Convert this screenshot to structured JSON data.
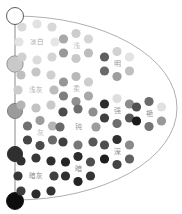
{
  "figure": {
    "background": "#ffffff",
    "outline": {
      "color": "#9a9a9a",
      "width": 0.8,
      "ellipse": {
        "cx": 15,
        "cy": 108,
        "rx": 162,
        "ry": 92
      }
    },
    "gray_axis": {
      "x": 15,
      "y_top": 16,
      "y_bottom": 200,
      "line_color": "#8a8a8a",
      "line_width": 1,
      "circles": [
        {
          "name": "white",
          "cy": 16,
          "r": 8.5,
          "fill": "#ffffff",
          "stroke": "#4a4a4a"
        },
        {
          "name": "light-gray",
          "cy": 64,
          "r": 8.2,
          "fill": "#c9c9c9",
          "stroke": "#8e8e8e"
        },
        {
          "name": "medium-gray",
          "cy": 111,
          "r": 7.6,
          "fill": "#9b9b9b",
          "stroke": "#7a7a7a"
        },
        {
          "name": "dark-gray",
          "cy": 154,
          "r": 7.6,
          "fill": "#2f2f2f",
          "stroke": "#2a2a2a"
        },
        {
          "name": "black",
          "cy": 201,
          "r": 8.5,
          "fill": "#0d0d0d",
          "stroke": "#0d0d0d"
        }
      ]
    },
    "tone_clusters": [
      {
        "tone": "pale",
        "label": "淡白",
        "cx": 37,
        "cy": 42,
        "ring": "oct",
        "label_color": "#a8a8a8",
        "font": 6.5,
        "dots": [
          "#e2e2e2",
          "#d8d8d8",
          "#e6e6e6",
          "#d4d4d4",
          "#dcdcdc",
          "#d0d0d0",
          "#e4e4e4",
          "#dadada"
        ]
      },
      {
        "tone": "light",
        "label": "浅",
        "cx": 76,
        "cy": 46,
        "ring": "hex",
        "label_color": "#c2c2c2",
        "font": 7,
        "dots": [
          "#cdcdcd",
          "#d5d5d5",
          "#bdbdbd",
          "#c9c9c9",
          "#989898",
          "#a8a8a8"
        ]
      },
      {
        "tone": "bright",
        "label": "明",
        "cx": 117,
        "cy": 64,
        "ring": "hex",
        "label_color": "#9a9a9a",
        "font": 7,
        "dots": [
          "#d2d2d2",
          "#e3e3e3",
          "#c0c0c0",
          "#9e9e9e",
          "#6a6a6a",
          "#5f5f5f"
        ]
      },
      {
        "tone": "light-grayish",
        "label": "浅灰",
        "cx": 36,
        "cy": 90,
        "ring": "oct",
        "label_color": "#b0b0b0",
        "font": 6.5,
        "dots": [
          "#c6c6c6",
          "#cfcfcf",
          "#bcbcbc",
          "#c9c9c9",
          "#c2c2c2",
          "#b4b4b4",
          "#cccccc",
          "#bfbfbf"
        ]
      },
      {
        "tone": "soft",
        "label": "柔",
        "cx": 76,
        "cy": 89,
        "ring": "hex",
        "label_color": "#bdbdbd",
        "font": 7,
        "dots": [
          "#b9b9b9",
          "#cdcdcd",
          "#a8a8a8",
          "#909090",
          "#7e7e7e",
          "#969696"
        ]
      },
      {
        "tone": "strong",
        "label": "强",
        "cx": 117,
        "cy": 111,
        "ring": "hex",
        "label_color": "#9a9a9a",
        "font": 7,
        "dots": [
          "#dedede",
          "#8c8c8c",
          "#565656",
          "#6e6e6e",
          "#3f3f3f",
          "#2d2d2d"
        ]
      },
      {
        "tone": "vivid",
        "label": "艳",
        "cx": 149,
        "cy": 114,
        "ring": "hex",
        "label_color": "#8f8f8f",
        "font": 7,
        "dots": [
          "#6b6b6b",
          "#e1e1e1",
          "#989898",
          "#757575",
          "#1b1b1b",
          "#515151"
        ]
      },
      {
        "tone": "grayish",
        "label": "灰",
        "cx": 40,
        "cy": 133,
        "ring": "hex",
        "label_color": "#b8b8b8",
        "font": 7,
        "dots": [
          "#9c9c9c",
          "#b5b5b5",
          "#6a6a6a",
          "#4a4a4a",
          "#454545",
          "#707070"
        ]
      },
      {
        "tone": "dull",
        "label": "钝",
        "cx": 78,
        "cy": 127,
        "ring": "oct",
        "label_color": "#9a9a9a",
        "font": 7,
        "dots": [
          "#6e6e6e",
          "#8e8e8e",
          "#9c9c9c",
          "#585858",
          "#777777",
          "#3f3f3f",
          "#696969",
          "#4c4c4c"
        ]
      },
      {
        "tone": "deep",
        "label": "深",
        "cx": 117,
        "cy": 152,
        "ring": "hex",
        "label_color": "#8a8a8a",
        "font": 7,
        "dots": [
          "#303030",
          "#8a8a8a",
          "#606060",
          "#434343",
          "#1e1e1e",
          "#4e4e4e"
        ]
      },
      {
        "tone": "dark-grayish",
        "label": "暗灰",
        "cx": 36,
        "cy": 176,
        "ring": "oct",
        "label_color": "#8a8a8a",
        "font": 6.5,
        "dots": [
          "#383838",
          "#2e2e2e",
          "#404040",
          "#333333",
          "#2b2b2b",
          "#3d3d3d",
          "#363636",
          "#303030"
        ]
      },
      {
        "tone": "dark",
        "label": "暗",
        "cx": 78,
        "cy": 169,
        "ring": "hex",
        "label_color": "#8a8a8a",
        "font": 7,
        "dots": [
          "#2c2c2c",
          "#4f4f4f",
          "#353535",
          "#232323",
          "#2e2e2e",
          "#262626"
        ]
      }
    ],
    "dot_radius": 4.6
  }
}
